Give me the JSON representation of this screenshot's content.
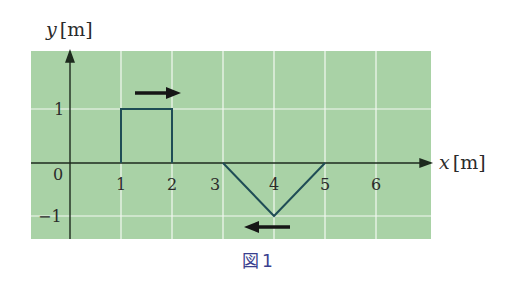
{
  "figure": {
    "caption_glyph": "図",
    "caption_number": "1",
    "panel_color": "#a9d2a6",
    "grid_color": "#f4f8f2",
    "axis_color": "#1e2a1e",
    "wave_color": "#1f4d56",
    "arrow_color": "#161616"
  },
  "axes": {
    "y_label_var": "y",
    "y_label_unit": "[m]",
    "x_label_var": "x",
    "x_label_unit": "[m]",
    "origin_label": "0",
    "x_ticks": [
      "1",
      "2",
      "3",
      "4",
      "5",
      "6"
    ],
    "y_ticks": [
      "1",
      "−1"
    ]
  },
  "pulses": [
    {
      "name": "rectangular-pulse",
      "shape": "rectangle",
      "points": [
        [
          1,
          0
        ],
        [
          1,
          1
        ],
        [
          2,
          1
        ],
        [
          2,
          0
        ]
      ],
      "direction": "right"
    },
    {
      "name": "triangular-pulse",
      "shape": "triangle",
      "points": [
        [
          3,
          0
        ],
        [
          4,
          -1
        ],
        [
          5,
          0
        ]
      ],
      "direction": "left"
    }
  ]
}
